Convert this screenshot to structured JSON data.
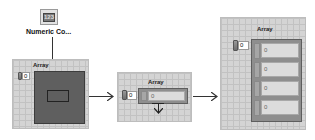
{
  "numeric_control": {
    "icon_glyph": "123",
    "caption": "Numeric Co..."
  },
  "stage1": {
    "label": "Array",
    "index_value": "0"
  },
  "stage2": {
    "label": "Array",
    "index_value": "0",
    "element_value": "0"
  },
  "stage3": {
    "label": "Array",
    "index_value": "0",
    "elements": [
      "0",
      "0",
      "0",
      "0"
    ]
  },
  "colors": {
    "arrow": "#333333",
    "grid_bg": "#d4d4d4",
    "shell_dark": "#5f5f5f"
  }
}
